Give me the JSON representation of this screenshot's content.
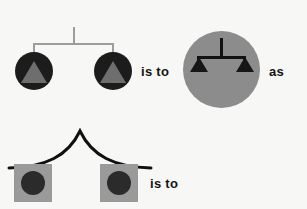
{
  "puzzle": {
    "type": "visual-analogy",
    "background_color": "#f7f7f6",
    "relations": {
      "top_relation_label": "is to",
      "conjunction_label": "as",
      "bottom_relation_label": "is to"
    },
    "top_row": {
      "term_a": {
        "name": "two-dark-circles-with-gray-triangles-under-light-bracket",
        "connector": {
          "icon": "t-bracket-icon",
          "color": "#9d9d9d",
          "stem_height": 17,
          "bar_width": 80
        },
        "items": [
          {
            "outer": {
              "shape": "circle",
              "color": "#1c1c1c",
              "diameter": 38
            },
            "inner": {
              "shape": "triangle",
              "color": "#6e6e6e",
              "width": 26,
              "height": 22
            }
          },
          {
            "outer": {
              "shape": "circle",
              "color": "#1c1c1c",
              "diameter": 38
            },
            "inner": {
              "shape": "triangle",
              "color": "#6e6e6e",
              "width": 26,
              "height": 22
            }
          }
        ]
      },
      "term_b": {
        "name": "large-gray-circle-containing-dark-bracket-and-triangles",
        "outer": {
          "shape": "circle",
          "color": "#8c8c8c",
          "diameter": 76
        },
        "connector": {
          "icon": "t-bracket-icon",
          "color": "#121212",
          "stem_height": 18,
          "bar_width": 46
        },
        "items": [
          {
            "shape": "triangle",
            "color": "#161616",
            "width": 18,
            "height": 15
          },
          {
            "shape": "triangle",
            "color": "#161616",
            "width": 18,
            "height": 15
          }
        ]
      }
    },
    "bottom_row": {
      "term_a": {
        "name": "two-gray-squares-with-dark-circles-under-black-arch",
        "connector": {
          "icon": "arch-curve-icon",
          "color": "#101010",
          "stroke_width": 3,
          "peak_x": 75,
          "peak_y": 3,
          "span_left_x": 4,
          "span_right_x": 147,
          "base_y": 37
        },
        "items": [
          {
            "outer": {
              "shape": "square",
              "color": "#9a9a9a",
              "size": 38
            },
            "inner": {
              "shape": "circle",
              "color": "#2b2b2b",
              "diameter": 24
            }
          },
          {
            "outer": {
              "shape": "square",
              "color": "#9a9a9a",
              "size": 38
            },
            "inner": {
              "shape": "circle",
              "color": "#2b2b2b",
              "diameter": 24
            }
          }
        ]
      },
      "term_b": {
        "name": "answer-blank",
        "content": ""
      }
    }
  }
}
